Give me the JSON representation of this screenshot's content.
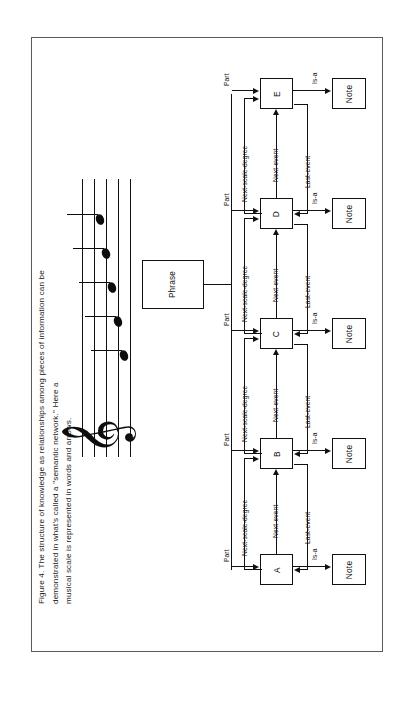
{
  "figure": {
    "caption_lines": [
      "Figure 4. The structure of knowledge as relationships among pieces of information can be",
      "demonstrated in what's called a \"semantic network.\" Here a",
      "musical scale is represented in words and arrows."
    ],
    "caption_full": "Figure 4. The structure of knowledge as relationships among pieces of information can be demonstrated in what's called a \"semantic network.\" Here a musical scale is represented in words and arrows."
  },
  "staff": {
    "clef_glyph": "𝄞",
    "clef_name": "treble-clef",
    "note_count": 5,
    "notes": [
      "C",
      "D",
      "E",
      "F",
      "G"
    ]
  },
  "diagram": {
    "root": {
      "label": "Phrase"
    },
    "part_label": "Part",
    "next_scale_degree_label": "Next-scale-degree",
    "next_event_label": "Next-event",
    "last_event_label": "Last-event",
    "is_a_label": "Is-a",
    "note_label": "Note",
    "pitch_nodes": [
      {
        "label": "A"
      },
      {
        "label": "B"
      },
      {
        "label": "C"
      },
      {
        "label": "D"
      },
      {
        "label": "E"
      }
    ],
    "note_nodes": [
      {
        "label": "Note"
      },
      {
        "label": "Note"
      },
      {
        "label": "Note"
      },
      {
        "label": "Note"
      },
      {
        "label": "Note"
      }
    ],
    "part_labels": [
      "Part",
      "Part",
      "Part",
      "Part",
      "Part"
    ],
    "scale_degree_labels": [
      "Next-scale-degree",
      "Next-scale-degree",
      "Next-scale-degree",
      "Next-scale-degree"
    ],
    "next_event_labels": [
      "Next-event",
      "Next-event",
      "Next-event",
      "Next-event"
    ],
    "last_event_labels": [
      "Last-event",
      "Last-event",
      "Last-event",
      "Last-event"
    ],
    "is_a_labels": [
      "Is-a",
      "Is-a",
      "Is-a",
      "Is-a",
      "Is-a"
    ]
  },
  "colors": {
    "ink": "#111111",
    "border": "#5a5a5a",
    "paper": "#ffffff"
  }
}
